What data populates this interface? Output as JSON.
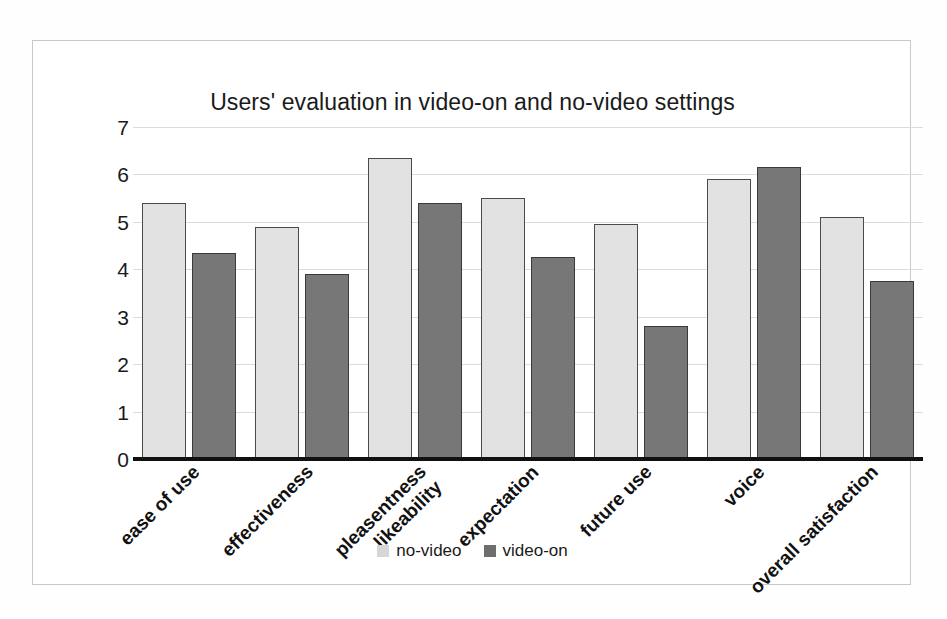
{
  "chart_data": {
    "type": "bar",
    "title": "Users' evaluation in video-on and no-video settings",
    "xlabel": "",
    "ylabel": "",
    "ylim": [
      0,
      7
    ],
    "yticks": [
      "0",
      "1",
      "2",
      "3",
      "4",
      "5",
      "6",
      "7"
    ],
    "grid": true,
    "legend_position": "bottom",
    "categories": [
      "ease of use",
      "effectiveness",
      "pleasentness likeability",
      "expectation",
      "future use",
      "voice",
      "overall satisfaction"
    ],
    "category_lines": [
      [
        "ease of use"
      ],
      [
        "effectiveness"
      ],
      [
        "pleasentness",
        "likeability"
      ],
      [
        "expectation"
      ],
      [
        "future use"
      ],
      [
        "voice"
      ],
      [
        "overall satisfaction"
      ]
    ],
    "series": [
      {
        "name": "no-video",
        "color": "#e2e2e2",
        "values": [
          5.4,
          4.9,
          6.35,
          5.5,
          4.95,
          5.9,
          5.1
        ]
      },
      {
        "name": "video-on",
        "color": "#777777",
        "values": [
          4.35,
          3.9,
          5.4,
          4.25,
          2.8,
          6.15,
          3.75
        ]
      }
    ]
  },
  "legend": {
    "items": [
      {
        "label": "no-video",
        "swatch": "light-gray-square"
      },
      {
        "label": "video-on",
        "swatch": "dark-gray-square"
      }
    ]
  },
  "colors": {
    "no_video_fill": "#e2e2e2",
    "video_on_fill": "#777777",
    "bar_outline": "#4a4a4a",
    "axis": "#111111",
    "gridline": "#dcdcdc",
    "frame": "#c8c8c8",
    "text": "#1a1a1a"
  }
}
